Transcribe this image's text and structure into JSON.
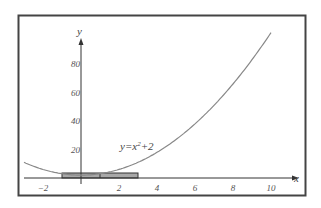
{
  "chart_data": {
    "type": "line",
    "title": "",
    "xlabel": "x",
    "ylabel": "y",
    "xlim": [
      -3,
      11
    ],
    "ylim": [
      0,
      100
    ],
    "grid": false,
    "x_ticks": [
      -2,
      2,
      4,
      6,
      8,
      10
    ],
    "x_tick_labels": [
      "−2",
      "2",
      "4",
      "6",
      "8",
      "10"
    ],
    "y_ticks": [
      20,
      40,
      60,
      80
    ],
    "y_tick_labels": [
      "20",
      "40",
      "60",
      "80"
    ],
    "series": [
      {
        "name": "y=x^2+2",
        "function": "x^2+2",
        "x": [
          -3,
          -2,
          -1,
          0,
          1,
          2,
          3,
          4,
          5,
          6,
          7,
          8,
          9,
          10
        ],
        "values": [
          11,
          6,
          3,
          2,
          3,
          6,
          11,
          18,
          27,
          38,
          51,
          66,
          83,
          102
        ]
      }
    ],
    "annotations": [
      {
        "text": "y=x²+2",
        "x": 2.1,
        "y": 24
      },
      {
        "type": "rectangle",
        "x_from": -1,
        "x_to": 3,
        "divider_at": 1,
        "height": 3
      }
    ],
    "legend": "none"
  },
  "labels": {
    "x_axis": "x",
    "y_axis": "y",
    "equation_main": "y=x",
    "equation_exp": "2",
    "equation_tail": "+2"
  },
  "colors": {
    "frame": "#444444",
    "axis": "#333333",
    "curve": "#888888",
    "rect_fill": "#a8a8a8",
    "rect_stroke": "#333333"
  }
}
